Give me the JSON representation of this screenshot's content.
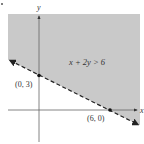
{
  "figure": {
    "inequality": "x + 2y > 6",
    "axis_labels": {
      "x": "x",
      "y": "y"
    },
    "points": [
      {
        "label": "(0, 3)",
        "x": 0,
        "y": 3
      },
      {
        "label": "(6, 0)",
        "x": 6,
        "y": 0
      }
    ],
    "boundary_line": {
      "equation": "x + 2y = 6",
      "style": "dashed"
    },
    "shaded_region": "above boundary line",
    "colors": {
      "shade": "#c9c9c9",
      "axis": "#555555",
      "line": "#222222",
      "text": "#333333"
    }
  }
}
